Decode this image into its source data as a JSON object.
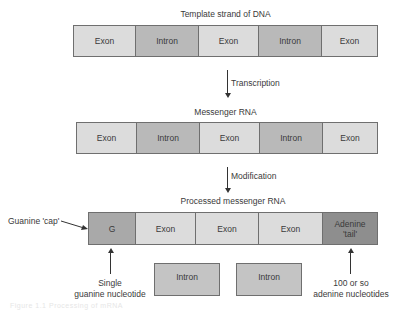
{
  "dna": {
    "title": "Template strand of DNA",
    "segments": [
      "Exon",
      "Intron",
      "Exon",
      "Intron",
      "Exon"
    ]
  },
  "transcription_label": "Transcription",
  "mrna": {
    "title": "Messenger RNA",
    "segments": [
      "Exon",
      "Intron",
      "Exon",
      "Intron",
      "Exon"
    ]
  },
  "modification_label": "Modification",
  "processed": {
    "title": "Processed messenger RNA",
    "segments": [
      "G",
      "Exon",
      "Exon",
      "Exon",
      "Adenine 'tail'"
    ],
    "cap_label": "Guanine 'cap'",
    "cap_note_line1": "Single",
    "cap_note_line2": "guanine nucleotide",
    "tail_note_line1": "100 or so",
    "tail_note_line2": "adenine nucleotides"
  },
  "removed_introns": [
    "Intron",
    "Intron"
  ],
  "colors": {
    "exon": "#dcdcdc",
    "intron": "#b9b9b9",
    "cap": "#a9a9a9",
    "tail": "#8e8e8e",
    "border": "#6f6f6f"
  },
  "caption": "Figure 1.1 Processing of mRNA"
}
